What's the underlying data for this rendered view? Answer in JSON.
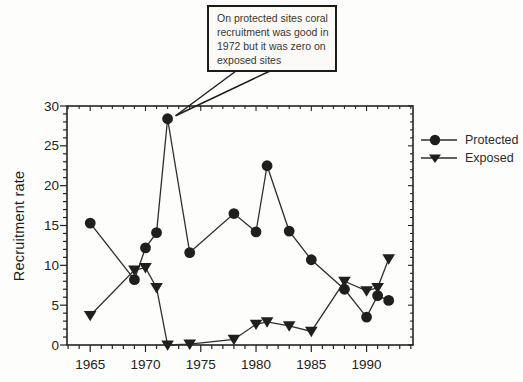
{
  "colors": {
    "ink": "#232321",
    "line": "#2e2e2c",
    "marker": "#1f1f1d"
  },
  "ylabel_text": "Recruitment rate",
  "annotation": {
    "full_text": "On protected sites coral recruitment was good in 1972 but it was zero on exposed sites",
    "lines": [
      "On protected sites coral",
      "recruitment was good in",
      "1972 but it was zero on",
      "exposed sites"
    ]
  },
  "chart_data": {
    "type": "line",
    "x": [
      1965,
      1969,
      1970,
      1971,
      1972,
      1974,
      1978,
      1980,
      1981,
      1983,
      1985,
      1988,
      1990,
      1991,
      1992
    ],
    "series": [
      {
        "name": "Protected",
        "marker": "circle",
        "values": [
          15.3,
          8.2,
          12.2,
          14.1,
          28.4,
          11.6,
          16.5,
          14.2,
          22.5,
          14.3,
          10.7,
          7.0,
          3.5,
          6.2,
          5.6
        ]
      },
      {
        "name": "Exposed",
        "marker": "triangle-down",
        "values": [
          3.7,
          9.4,
          9.7,
          7.2,
          0,
          0.1,
          0.7,
          2.6,
          2.9,
          2.4,
          1.7,
          8.0,
          6.8,
          7.2,
          10.8
        ]
      }
    ],
    "title": "",
    "xlabel": "",
    "ylabel": "Recruitment rate",
    "xlim": [
      1962.9,
      1994.2
    ],
    "ylim": [
      0,
      30
    ],
    "x_major_ticks": [
      1965,
      1970,
      1975,
      1980,
      1985,
      1990
    ],
    "y_major_ticks": [
      0,
      5,
      10,
      15,
      20,
      25,
      30
    ],
    "x_minor_step": 1,
    "y_minor_step": 1,
    "grid": false,
    "legend_position": "right",
    "annotation_target": {
      "x": 1972,
      "y": 28.4
    }
  }
}
